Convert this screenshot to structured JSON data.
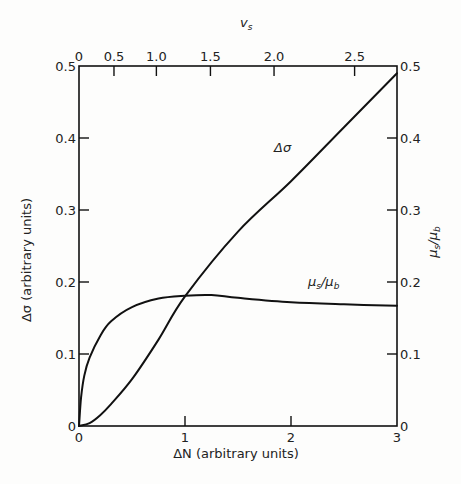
{
  "chart_data": {
    "type": "line",
    "title": "",
    "xlabel": "ΔN (arbitrary units)",
    "ylabel": "Δσ (arbitrary units)",
    "y2label": "μs/μb",
    "x2label": "vs",
    "xlim": [
      0,
      3
    ],
    "ylim": [
      0,
      0.5
    ],
    "y2lim": [
      0,
      0.5
    ],
    "grid": false,
    "legend": "inline labels on curves",
    "x_ticks": [
      "0",
      "1",
      "2",
      "3"
    ],
    "y_ticks": [
      "0",
      "0.1",
      "0.2",
      "0.3",
      "0.4",
      "0.5"
    ],
    "y2_ticks": [
      "0",
      "0.1",
      "0.2",
      "0.3",
      "0.4",
      "0.5"
    ],
    "x2_ticks": [
      {
        "label": "0",
        "at_dN": 0.0
      },
      {
        "label": "0.5",
        "at_dN": 0.33
      },
      {
        "label": "1.0",
        "at_dN": 0.73
      },
      {
        "label": "1.5",
        "at_dN": 1.24
      },
      {
        "label": "2.0",
        "at_dN": 1.84
      },
      {
        "label": "2.5",
        "at_dN": 2.6
      }
    ],
    "series": [
      {
        "name": "Δσ",
        "x": [
          0,
          0.1,
          0.2,
          0.3,
          0.5,
          0.75,
          1.0,
          1.5,
          2.0,
          2.5,
          3.0
        ],
        "values": [
          0,
          0.004,
          0.015,
          0.03,
          0.065,
          0.12,
          0.18,
          0.27,
          0.34,
          0.415,
          0.49
        ]
      },
      {
        "name": "μs/μb",
        "x": [
          0,
          0.02,
          0.05,
          0.1,
          0.2,
          0.3,
          0.5,
          0.75,
          1.0,
          1.25,
          1.5,
          2.0,
          2.5,
          3.0
        ],
        "values": [
          0,
          0.04,
          0.07,
          0.095,
          0.125,
          0.145,
          0.165,
          0.177,
          0.181,
          0.182,
          0.178,
          0.172,
          0.169,
          0.167
        ]
      }
    ],
    "annotations": [
      {
        "text": "Δσ",
        "near_dN": 1.9,
        "near_value": 0.39
      },
      {
        "text": "μs/μb",
        "near_dN": 2.15,
        "near_value": 0.195
      }
    ]
  },
  "labels": {
    "x_axis": "ΔN (arbitrary units)",
    "y_axis": "Δσ (arbitrary units)",
    "y2_axis_main": "μ",
    "y2_axis_sub1": "s",
    "y2_axis_mid": "/μ",
    "y2_axis_sub2": "b",
    "x2_axis_main": "v",
    "x2_axis_sub": "s",
    "curve_dsigma": "Δσ",
    "curve_mu_main": "μ",
    "curve_mu_sub1": "s",
    "curve_mu_mid": "/μ",
    "curve_mu_sub2": "b"
  }
}
